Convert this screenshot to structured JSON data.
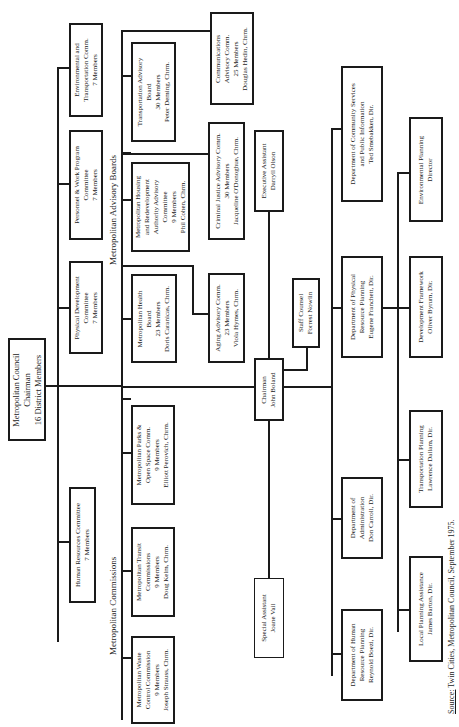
{
  "council": {
    "lines": [
      "Metropolitan Council",
      "Chairman",
      "16 District Members"
    ]
  },
  "committees": [
    {
      "lines": [
        "Environmental and",
        "Transportation Comm.",
        "7 Members"
      ]
    },
    {
      "lines": [
        "Personnel & Work Program",
        "Committee",
        "7 Members"
      ]
    },
    {
      "lines": [
        "Physical Development",
        "Committee",
        "7 Members"
      ]
    },
    {
      "lines": [
        "Human Resources Committee",
        "7 Members"
      ]
    }
  ],
  "section_labels": {
    "advisory_boards": "Metropolitan Advisory Boards",
    "commissions": "Metropolitan Commissions"
  },
  "advisory_boards": [
    {
      "lines": [
        "Transportation Advisory",
        "Board",
        "30 Members",
        "Peter Deming, Chrm."
      ]
    },
    {
      "lines": [
        "Metropolitan Housing",
        "and Redevelopment",
        "Authority Advisory",
        "Committee",
        "9 Members",
        "Phil Cohen, Chrm."
      ]
    },
    {
      "lines": [
        "Metropolitan Health",
        "Board",
        "23 Members",
        "Doris Caranicas, Chrm."
      ]
    },
    {
      "lines": [
        "Communications",
        "Advisory Comm.",
        "25 Members",
        "Douglas Hedin, Chrm."
      ]
    },
    {
      "lines": [
        "Criminal Justice Advisory Comm.",
        "30 Members",
        "Jacqueline O'Donoghue, Chrm."
      ]
    },
    {
      "lines": [
        "Aging Advisory Comm.",
        "23 Members",
        "Viola Hymes, Chrm."
      ]
    }
  ],
  "commissions": [
    {
      "lines": [
        "Metropolitan Parks &",
        "Open Space Comm.",
        "9 Members",
        "Elliott Perovich, Chrm."
      ]
    },
    {
      "lines": [
        "Metropolitan Transit",
        "Commissions",
        "9 Members",
        "Doug Kelm, Chrm."
      ]
    },
    {
      "lines": [
        "Metropolitan Waste",
        "Control Commission",
        "9 Members",
        "Joseph Strauss, Chrm."
      ]
    }
  ],
  "staff": {
    "executive_assistant": {
      "lines": [
        "Executive Assistant",
        "Darryll Olson"
      ]
    },
    "chairman": {
      "lines": [
        "Chairman",
        "John Boland"
      ]
    },
    "staff_counsel": {
      "lines": [
        "Staff Counsel",
        "Forrest Nowlin"
      ]
    },
    "special_assistant": {
      "lines": [
        "Special Assistant",
        "Joane Vail"
      ]
    }
  },
  "departments": [
    {
      "lines": [
        "Department of Community Services",
        "and Public Information",
        "Ted Smebakken, Dir."
      ]
    },
    {
      "lines": [
        "Department of Physical",
        "Resource Planning",
        "Eugene Franchett, Dir."
      ]
    },
    {
      "lines": [
        "Department of",
        "Administration",
        "Don Carroll, Dir."
      ]
    },
    {
      "lines": [
        "Department of Human",
        "Resource Planning",
        "Reynold Boezi, Dir."
      ]
    }
  ],
  "divisions": [
    {
      "lines": [
        "Environmental Planning",
        "Director"
      ]
    },
    {
      "lines": [
        "Development Framework",
        "Oliver Byrum, Dir."
      ]
    },
    {
      "lines": [
        "Transportation Planning",
        "Lawrence Dallam, Dir."
      ]
    },
    {
      "lines": [
        "Local Planning Assistance",
        "James Barton, Dir."
      ]
    }
  ],
  "source": {
    "prefix": "Source:",
    "text": " Twin Cities, Metropolitan Council, September 1975."
  }
}
